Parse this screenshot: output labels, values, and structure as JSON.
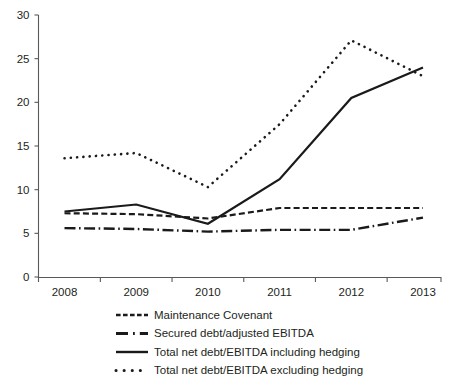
{
  "chart_data": {
    "type": "line",
    "title": "",
    "xlabel": "",
    "ylabel": "",
    "categories": [
      "2008",
      "2009",
      "2010",
      "2011",
      "2012",
      "2013"
    ],
    "x_tick_labels": [
      "2008",
      "2009",
      "2010",
      "2011",
      "2012",
      "2013"
    ],
    "y_tick_labels": [
      "0",
      "5",
      "10",
      "15",
      "20",
      "25",
      "30"
    ],
    "y_ticks": [
      0,
      5,
      10,
      15,
      20,
      25,
      30
    ],
    "ylim": [
      0,
      30
    ],
    "grid": false,
    "legend_position": "bottom",
    "series": [
      {
        "name": "Maintenance Covenant",
        "style": "dashed",
        "color": "#1a1a1a",
        "values": [
          7.3,
          7.2,
          6.7,
          7.9,
          7.9,
          7.9
        ]
      },
      {
        "name": "Secured debt/adjusted EBITDA",
        "style": "dash-dot",
        "color": "#1a1a1a",
        "values": [
          5.6,
          5.5,
          5.2,
          5.4,
          5.4,
          6.8
        ]
      },
      {
        "name": "Total net debt/EBITDA including hedging",
        "style": "solid",
        "color": "#1a1a1a",
        "values": [
          7.5,
          8.3,
          6.1,
          11.2,
          20.5,
          24.0
        ]
      },
      {
        "name": "Total net debt/EBITDA excluding hedging",
        "style": "dotted",
        "color": "#1a1a1a",
        "values": [
          13.6,
          14.2,
          10.3,
          17.5,
          27.1,
          23.0
        ]
      }
    ]
  },
  "legend": {
    "items": [
      {
        "label": "Maintenance Covenant",
        "style": "dashed"
      },
      {
        "label": "Secured debt/adjusted EBITDA",
        "style": "dash-dot"
      },
      {
        "label": "Total net debt/EBITDA including hedging",
        "style": "solid"
      },
      {
        "label": "Total net debt/EBITDA excluding hedging",
        "style": "dotted"
      }
    ]
  }
}
